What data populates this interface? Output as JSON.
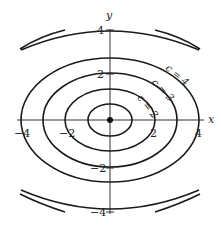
{
  "figure": {
    "type": "contour-plot",
    "axes": {
      "x_label": "x",
      "y_label": "y",
      "x_ticks": [
        "−4",
        "−2",
        "2",
        "4"
      ],
      "y_ticks": [
        "4",
        "2",
        "−2",
        "−4"
      ]
    },
    "origin_point": "dot at origin",
    "level_curve_labels": [
      "c = 2",
      "c = 3",
      "c = 4"
    ],
    "level_curves_count": 6,
    "colors": {
      "stroke": "#1a1a1a",
      "background": "#ffffff"
    }
  }
}
